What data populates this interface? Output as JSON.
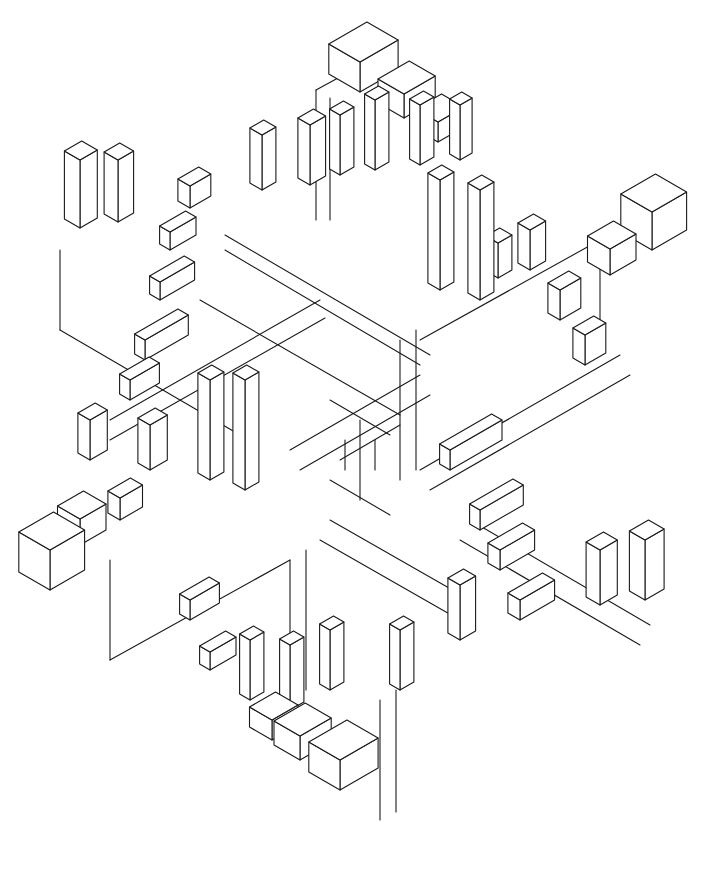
{
  "artwork": {
    "title": "",
    "background": "#ffffff",
    "stroke": "#1a1a1a",
    "description": "Isometric six-armed star of nested blocks (line art)",
    "blocks": [
      {
        "x": 360,
        "y": 92,
        "w": 44,
        "d": 36,
        "h": 30
      },
      {
        "x": 404,
        "y": 118,
        "w": 36,
        "d": 30,
        "h": 24
      },
      {
        "x": 438,
        "y": 142,
        "w": 30,
        "d": 26,
        "h": 20
      },
      {
        "x": 340,
        "y": 175,
        "w": 16,
        "d": 12,
        "h": 60
      },
      {
        "x": 375,
        "y": 170,
        "w": 16,
        "d": 12,
        "h": 70
      },
      {
        "x": 420,
        "y": 165,
        "w": 16,
        "d": 12,
        "h": 60
      },
      {
        "x": 460,
        "y": 160,
        "w": 14,
        "d": 12,
        "h": 55
      },
      {
        "x": 262,
        "y": 190,
        "w": 16,
        "d": 14,
        "h": 55
      },
      {
        "x": 310,
        "y": 185,
        "w": 18,
        "d": 14,
        "h": 60
      },
      {
        "x": 80,
        "y": 228,
        "w": 20,
        "d": 18,
        "h": 68
      },
      {
        "x": 118,
        "y": 222,
        "w": 18,
        "d": 16,
        "h": 62
      },
      {
        "x": 190,
        "y": 208,
        "w": 24,
        "d": 14,
        "h": 22
      },
      {
        "x": 170,
        "y": 250,
        "w": 30,
        "d": 12,
        "h": 18
      },
      {
        "x": 160,
        "y": 300,
        "w": 40,
        "d": 12,
        "h": 18
      },
      {
        "x": 145,
        "y": 360,
        "w": 50,
        "d": 12,
        "h": 20
      },
      {
        "x": 130,
        "y": 400,
        "w": 34,
        "d": 12,
        "h": 20
      },
      {
        "x": 652,
        "y": 250,
        "w": 40,
        "d": 36,
        "h": 38
      },
      {
        "x": 610,
        "y": 275,
        "w": 30,
        "d": 26,
        "h": 26
      },
      {
        "x": 560,
        "y": 320,
        "w": 24,
        "d": 14,
        "h": 30
      },
      {
        "x": 585,
        "y": 365,
        "w": 24,
        "d": 14,
        "h": 30
      },
      {
        "x": 530,
        "y": 270,
        "w": 18,
        "d": 14,
        "h": 40
      },
      {
        "x": 498,
        "y": 278,
        "w": 16,
        "d": 14,
        "h": 35
      },
      {
        "x": 50,
        "y": 590,
        "w": 40,
        "d": 36,
        "h": 40
      },
      {
        "x": 80,
        "y": 545,
        "w": 30,
        "d": 26,
        "h": 26
      },
      {
        "x": 90,
        "y": 460,
        "w": 20,
        "d": 14,
        "h": 40
      },
      {
        "x": 150,
        "y": 470,
        "w": 20,
        "d": 14,
        "h": 45
      },
      {
        "x": 120,
        "y": 520,
        "w": 26,
        "d": 14,
        "h": 22
      },
      {
        "x": 645,
        "y": 600,
        "w": 22,
        "d": 18,
        "h": 60
      },
      {
        "x": 600,
        "y": 605,
        "w": 20,
        "d": 16,
        "h": 55
      },
      {
        "x": 520,
        "y": 620,
        "w": 40,
        "d": 14,
        "h": 20
      },
      {
        "x": 500,
        "y": 570,
        "w": 40,
        "d": 14,
        "h": 20
      },
      {
        "x": 480,
        "y": 530,
        "w": 50,
        "d": 12,
        "h": 20
      },
      {
        "x": 450,
        "y": 470,
        "w": 60,
        "d": 12,
        "h": 20
      },
      {
        "x": 460,
        "y": 640,
        "w": 18,
        "d": 14,
        "h": 55
      },
      {
        "x": 340,
        "y": 790,
        "w": 44,
        "d": 36,
        "h": 30
      },
      {
        "x": 300,
        "y": 760,
        "w": 36,
        "d": 30,
        "h": 24
      },
      {
        "x": 272,
        "y": 740,
        "w": 30,
        "d": 26,
        "h": 20
      },
      {
        "x": 250,
        "y": 700,
        "w": 16,
        "d": 12,
        "h": 60
      },
      {
        "x": 290,
        "y": 710,
        "w": 16,
        "d": 12,
        "h": 65
      },
      {
        "x": 330,
        "y": 690,
        "w": 16,
        "d": 12,
        "h": 60
      },
      {
        "x": 400,
        "y": 690,
        "w": 16,
        "d": 12,
        "h": 60
      },
      {
        "x": 210,
        "y": 670,
        "w": 30,
        "d": 12,
        "h": 18
      },
      {
        "x": 190,
        "y": 620,
        "w": 34,
        "d": 12,
        "h": 20
      },
      {
        "x": 210,
        "y": 480,
        "w": 16,
        "d": 14,
        "h": 100
      },
      {
        "x": 245,
        "y": 490,
        "w": 16,
        "d": 14,
        "h": 110
      },
      {
        "x": 440,
        "y": 290,
        "w": 16,
        "d": 14,
        "h": 110
      },
      {
        "x": 480,
        "y": 300,
        "w": 16,
        "d": 14,
        "h": 110
      }
    ],
    "lines": [
      [
        316,
        90,
        316,
        220
      ],
      [
        316,
        90,
        360,
        66
      ],
      [
        330,
        98,
        330,
        220
      ],
      [
        225,
        235,
        430,
        355
      ],
      [
        225,
        250,
        420,
        365
      ],
      [
        200,
        300,
        400,
        415
      ],
      [
        110,
        420,
        320,
        300
      ],
      [
        110,
        440,
        325,
        318
      ],
      [
        60,
        330,
        240,
        435
      ],
      [
        60,
        330,
        60,
        250
      ],
      [
        290,
        450,
        420,
        375
      ],
      [
        300,
        470,
        430,
        395
      ],
      [
        420,
        470,
        620,
        355
      ],
      [
        430,
        490,
        630,
        375
      ],
      [
        470,
        520,
        650,
        625
      ],
      [
        460,
        540,
        640,
        645
      ],
      [
        330,
        520,
        470,
        600
      ],
      [
        320,
        540,
        460,
        620
      ],
      [
        290,
        560,
        290,
        700
      ],
      [
        306,
        550,
        306,
        690
      ],
      [
        400,
        340,
        400,
        480
      ],
      [
        416,
        330,
        416,
        470
      ],
      [
        110,
        560,
        110,
        660
      ],
      [
        110,
        660,
        290,
        560
      ],
      [
        600,
        240,
        600,
        340
      ],
      [
        600,
        240,
        420,
        340
      ],
      [
        380,
        700,
        380,
        820
      ],
      [
        396,
        690,
        396,
        812
      ],
      [
        330,
        400,
        390,
        435
      ],
      [
        360,
        420,
        360,
        500
      ],
      [
        340,
        460,
        400,
        425
      ],
      [
        330,
        480,
        390,
        515
      ],
      [
        345,
        440,
        345,
        470
      ],
      [
        375,
        440,
        375,
        470
      ]
    ]
  }
}
